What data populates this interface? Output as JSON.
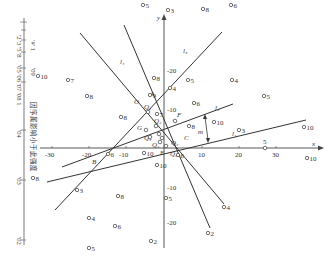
{
  "figure": {
    "type": "coordinate-geometry-diagram",
    "axes": {
      "x_label": "x",
      "y_label": "y",
      "x_ticks": [
        "-30",
        "-20",
        "-10",
        "10",
        "20",
        "30"
      ],
      "y_ticks_top": [
        "-10",
        "-20"
      ],
      "y_ticks_bottom": [
        "-10",
        "-20"
      ],
      "scale_marker": "5"
    },
    "lines": [
      {
        "id": "l1",
        "label": "l₁"
      },
      {
        "id": "l2",
        "label": "l₂"
      },
      {
        "id": "l3",
        "label": "l₃"
      },
      {
        "id": "l4",
        "label": "l₄"
      },
      {
        "id": "l5",
        "label": "l₅"
      }
    ],
    "intersection_labels": [
      "A",
      "B",
      "C",
      "E",
      "F",
      "G",
      "O"
    ],
    "center_labels": [
      "Q₁",
      "Q₂",
      "Q₃",
      "Q₄",
      "Q₅",
      "Q₆"
    ],
    "distance_label": "m",
    "points": [
      {
        "n": "10",
        "x": 38,
        "y": 76
      },
      {
        "n": "7",
        "x": 68,
        "y": 80
      },
      {
        "n": "8",
        "x": 87,
        "y": 96
      },
      {
        "n": "5",
        "x": 143,
        "y": 5
      },
      {
        "n": "3",
        "x": 168,
        "y": 10
      },
      {
        "n": "8",
        "x": 203,
        "y": 9
      },
      {
        "n": "6",
        "x": 231,
        "y": 5
      },
      {
        "n": "8",
        "x": 154,
        "y": 78
      },
      {
        "n": "4",
        "x": 170,
        "y": 88
      },
      {
        "n": "5",
        "x": 188,
        "y": 80
      },
      {
        "n": "4",
        "x": 232,
        "y": 80
      },
      {
        "n": "9",
        "x": 150,
        "y": 95
      },
      {
        "n": "8",
        "x": 121,
        "y": 117
      },
      {
        "n": "6",
        "x": 194,
        "y": 103
      },
      {
        "n": "7",
        "x": 157,
        "y": 114
      },
      {
        "n": "5",
        "x": 264,
        "y": 96
      },
      {
        "n": "10",
        "x": 214,
        "y": 122
      },
      {
        "n": "10",
        "x": 304,
        "y": 127
      },
      {
        "n": "8",
        "x": 189,
        "y": 126
      },
      {
        "n": "3",
        "x": 239,
        "y": 130
      },
      {
        "n": "6",
        "x": 108,
        "y": 154
      },
      {
        "n": "10",
        "x": 144,
        "y": 153
      },
      {
        "n": "6",
        "x": 178,
        "y": 155
      },
      {
        "n": "10",
        "x": 307,
        "y": 158
      },
      {
        "n": "8",
        "x": 33,
        "y": 178
      },
      {
        "n": "3",
        "x": 77,
        "y": 190
      },
      {
        "n": "8",
        "x": 118,
        "y": 196
      },
      {
        "n": "5",
        "x": 166,
        "y": 198
      },
      {
        "n": "4",
        "x": 89,
        "y": 218
      },
      {
        "n": "6",
        "x": 115,
        "y": 226
      },
      {
        "n": "4",
        "x": 224,
        "y": 207
      },
      {
        "n": "2",
        "x": 151,
        "y": 241
      },
      {
        "n": "2",
        "x": 208,
        "y": 233
      },
      {
        "n": "5",
        "x": 89,
        "y": 248
      },
      {
        "n": "10",
        "x": 157,
        "y": 165
      }
    ],
    "scale_bar": {
      "caption": "因序属影响小于此强度",
      "ticks": [
        "'02",
        "'03",
        "'04",
        "'05 '06 '07 '08 1",
        "'2 '3 '5 '8"
      ],
      "unit_top": "′#′ 1",
      "mid_marks": [
        "'09",
        "√′"
      ]
    }
  }
}
